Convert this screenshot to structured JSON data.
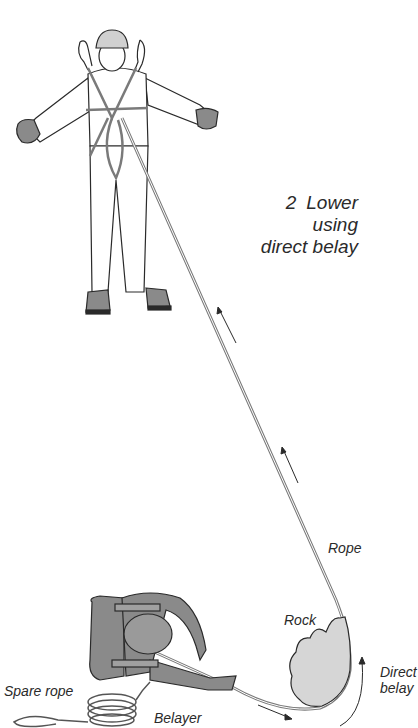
{
  "title": {
    "number": "2",
    "line1": "Lower using",
    "line2": "direct belay"
  },
  "labels": {
    "rope": "Rope",
    "rock": "Rock",
    "direct_belay_line1": "Direct",
    "direct_belay_line2": "belay",
    "spare_rope": "Spare rope",
    "belayer": "Belayer"
  },
  "colors": {
    "ink": "#2a2a2a",
    "figure_fill": "#8a8a8a",
    "rock_fill": "#d6d6d6",
    "rope": "#7a7a7a",
    "background": "#ffffff"
  }
}
